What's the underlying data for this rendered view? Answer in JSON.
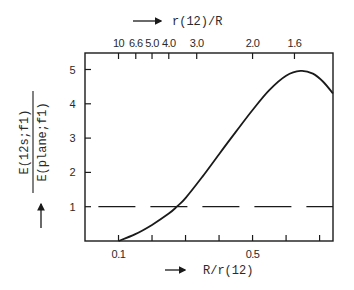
{
  "chart_data": {
    "type": "line",
    "title": "",
    "xlabel": "R/r(12)",
    "x2label": "r(12)/R",
    "ylabel_numerator": "E(12s;f1)",
    "ylabel_denominator": "E(plane;f1)",
    "xlim": [
      0,
      0.74
    ],
    "ylim": [
      0,
      5.5
    ],
    "grid": false,
    "legend": null,
    "x_ticks": [
      0.1,
      0.2,
      0.3,
      0.4,
      0.5,
      0.6,
      0.7
    ],
    "x_tick_labels": [
      {
        "value": 0.1,
        "label": "0.1"
      },
      {
        "value": 0.5,
        "label": "0.5"
      }
    ],
    "x2_ticks": [
      {
        "value": 10,
        "label": "10"
      },
      {
        "value": 6.6,
        "label": "6.6"
      },
      {
        "value": 5.0,
        "label": "5.0"
      },
      {
        "value": 4.0,
        "label": "4.0"
      },
      {
        "value": 3.0,
        "label": "3.0"
      },
      {
        "value": 2.0,
        "label": "2.0"
      },
      {
        "value": 1.6,
        "label": "1.6"
      }
    ],
    "y_ticks": [
      {
        "value": 1,
        "label": "1"
      },
      {
        "value": 2,
        "label": "2"
      },
      {
        "value": 3,
        "label": "3"
      },
      {
        "value": 4,
        "label": "4"
      },
      {
        "value": 5,
        "label": "5"
      }
    ],
    "series": [
      {
        "name": "E(12s;f1)/E(plane;f1)",
        "style": "solid",
        "x": [
          0.1,
          0.15,
          0.2,
          0.25,
          0.274,
          0.3,
          0.35,
          0.4,
          0.45,
          0.5,
          0.55,
          0.6,
          0.643,
          0.68,
          0.71,
          0.74
        ],
        "y": [
          0.0,
          0.2,
          0.47,
          0.8,
          1.0,
          1.25,
          1.87,
          2.53,
          3.18,
          3.82,
          4.4,
          4.82,
          4.96,
          4.88,
          4.65,
          4.3
        ]
      },
      {
        "name": "reference = 1",
        "style": "dashed",
        "x": [
          0.04,
          0.74
        ],
        "y": [
          1,
          1
        ]
      }
    ]
  },
  "labels": {
    "top_axis": "r(12)/R",
    "bottom_axis": "R/r(12)",
    "y_numerator": "E(12s;f1)",
    "y_denominator": "E(plane;f1)"
  },
  "colors": {
    "ink": "#1a1a1a",
    "background": "#ffffff"
  }
}
